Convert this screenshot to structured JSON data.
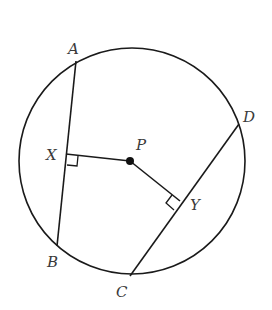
{
  "diagram": {
    "type": "circle-geometry",
    "circle": {
      "cx": 132,
      "cy": 161,
      "r": 113
    },
    "center": {
      "label": "P",
      "x": 130,
      "y": 161
    },
    "points": {
      "A": {
        "label": "A",
        "x": 76,
        "y": 61
      },
      "B": {
        "label": "B",
        "x": 57,
        "y": 246
      },
      "C": {
        "label": "C",
        "x": 130,
        "y": 276
      },
      "D": {
        "label": "D",
        "x": 239,
        "y": 124
      },
      "X": {
        "label": "X",
        "x": 66,
        "y": 154
      },
      "Y": {
        "label": "Y",
        "x": 180,
        "y": 201
      }
    },
    "segments": [
      "AB",
      "CD",
      "PX",
      "PY"
    ],
    "right_angles": [
      "X",
      "Y"
    ],
    "stroke_color": "#1a1a1a",
    "label_color": "#3a3a3a"
  }
}
